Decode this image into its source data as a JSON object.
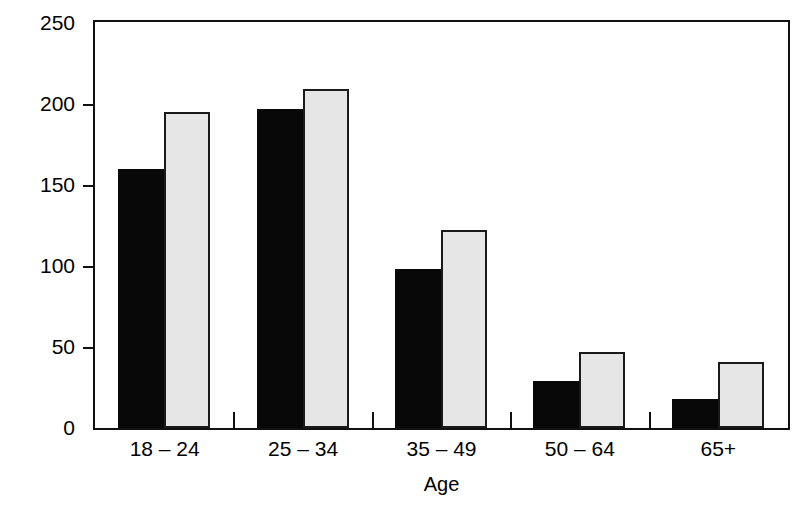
{
  "chart_data": {
    "type": "bar",
    "title": "",
    "xlabel": "Age",
    "ylabel": "Incidence per 100.000",
    "categories": [
      "18 – 24",
      "25 – 34",
      "35 – 49",
      "50 – 64",
      "65+"
    ],
    "series": [
      {
        "name": "series-1",
        "color": "#080808",
        "values": [
          160,
          197,
          98,
          29,
          18
        ]
      },
      {
        "name": "series-2",
        "color": "#e6e6e6",
        "values": [
          195,
          209,
          122,
          47,
          41
        ]
      }
    ],
    "ylim": [
      0,
      250
    ],
    "yticks": [
      0,
      50,
      100,
      150,
      200,
      250
    ],
    "ytick_labels": [
      "0",
      "50",
      "100",
      "150",
      "200",
      "250"
    ],
    "grid": false,
    "legend": "none"
  },
  "axes": {
    "y_title": "Incidence per 100.000",
    "x_title": "Age"
  }
}
